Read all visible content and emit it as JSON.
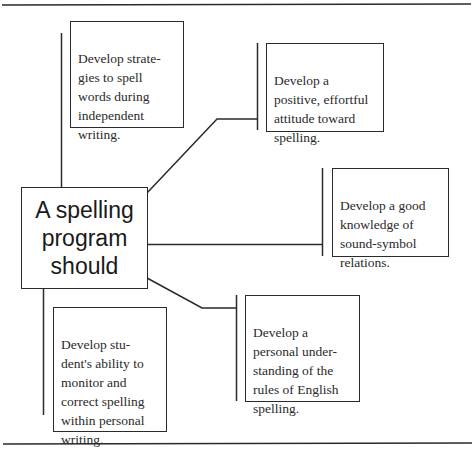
{
  "diagram": {
    "type": "concept-map",
    "center": {
      "label": "A spelling\nprogram\nshould"
    },
    "branches": [
      {
        "id": "strategies",
        "text": "Develop strate-\ngies to spell\nwords during\nindependent\nwriting."
      },
      {
        "id": "attitude",
        "text": "Develop a\npositive, effortful\nattitude toward\nspelling."
      },
      {
        "id": "sound-symbol",
        "text": "Develop a good\nknowledge of\nsound-symbol\nrelations."
      },
      {
        "id": "rules",
        "text": "Develop a\npersonal under-\nstanding of the\nrules of English\nspelling."
      },
      {
        "id": "monitor",
        "text": "Develop stu-\ndent's ability to\nmonitor and\ncorrect spelling\nwithin personal\nwriting."
      }
    ],
    "colors": {
      "line": "#2a2a2a",
      "background": "#ffffff",
      "text": "#2a2a2a"
    }
  }
}
